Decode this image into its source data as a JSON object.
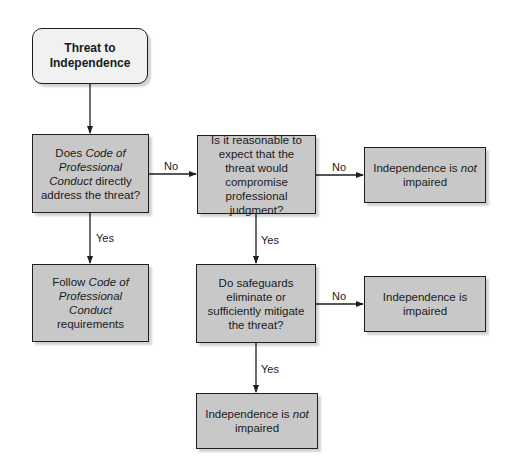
{
  "diagram": {
    "type": "flowchart",
    "colors": {
      "start_fill": "#f1f1f1",
      "node_fill": "#c8c8c8",
      "border": "#1e1e1e",
      "line": "#1e1e1e",
      "background": "#ffffff"
    },
    "nodes": {
      "start": {
        "shape": "rounded-rectangle",
        "line1": "Threat to",
        "line2": "Independence"
      },
      "q1": {
        "shape": "rectangle",
        "pre": "Does ",
        "italic": "Code of Professional Conduct",
        "post": " directly address the threat?"
      },
      "q2": {
        "shape": "rectangle",
        "text": "Is it reasonable to expect that the threat would compromise professional judgment?"
      },
      "q3": {
        "shape": "rectangle",
        "text": "Do safeguards eliminate or sufficiently mitigate the threat?"
      },
      "follow": {
        "shape": "rectangle",
        "pre": "Follow ",
        "italic": "Code of Professional Conduct",
        "post": " requirements"
      },
      "not_impaired_1": {
        "shape": "rectangle",
        "pre": "Independence is ",
        "italic": "not",
        "post": " impaired"
      },
      "impaired": {
        "shape": "rectangle",
        "text": "Independence is impaired"
      },
      "not_impaired_2": {
        "shape": "rectangle",
        "pre": "Independence is ",
        "italic": "not",
        "post": " impaired"
      }
    },
    "edges": [
      {
        "from": "start",
        "to": "q1",
        "label": ""
      },
      {
        "from": "q1",
        "to": "q2",
        "label": "No"
      },
      {
        "from": "q1",
        "to": "follow",
        "label": "Yes"
      },
      {
        "from": "q2",
        "to": "not_impaired_1",
        "label": "No"
      },
      {
        "from": "q2",
        "to": "q3",
        "label": "Yes"
      },
      {
        "from": "q3",
        "to": "impaired",
        "label": "No"
      },
      {
        "from": "q3",
        "to": "not_impaired_2",
        "label": "Yes"
      }
    ],
    "labels": {
      "q1_no": "No",
      "q1_yes": "Yes",
      "q2_no": "No",
      "q2_yes": "Yes",
      "q3_no": "No",
      "q3_yes": "Yes"
    }
  }
}
